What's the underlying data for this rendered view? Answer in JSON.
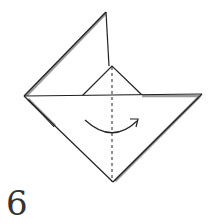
{
  "diagram": {
    "step_number": "6",
    "instruction": "valley fold along dashed center line",
    "colors": {
      "line": "#222222",
      "shadow": "#9a9a9a",
      "paper": "#ffffff",
      "number": "#333333"
    },
    "icons": {
      "fold_arrow": "curved-arrow-right",
      "fold_line": "dashed-valley-fold-line"
    }
  }
}
